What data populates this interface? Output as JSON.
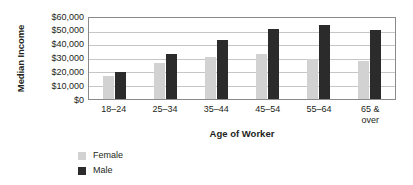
{
  "chart_data": {
    "type": "bar",
    "title": "",
    "xlabel": "Age of Worker",
    "ylabel": "Median Income",
    "categories": [
      "18–24",
      "25–34",
      "35–44",
      "45–54",
      "55–64",
      "65 &\nover"
    ],
    "series": [
      {
        "name": "Female",
        "color": "#d2d2d2",
        "values": [
          17000,
          27000,
          31000,
          33500,
          30000,
          28000
        ]
      },
      {
        "name": "Male",
        "color": "#2b2b2b",
        "values": [
          20000,
          33500,
          44000,
          52000,
          54500,
          51000
        ]
      }
    ],
    "ylim": [
      0,
      60000
    ],
    "yticks": [
      0,
      10000,
      20000,
      30000,
      40000,
      50000,
      60000
    ],
    "ytick_labels": [
      "$0",
      "$10,000",
      "$20,000",
      "$30,000",
      "$40,000",
      "$50,000",
      "$60,000"
    ],
    "grid": true,
    "legend_position": "bottom-left"
  }
}
